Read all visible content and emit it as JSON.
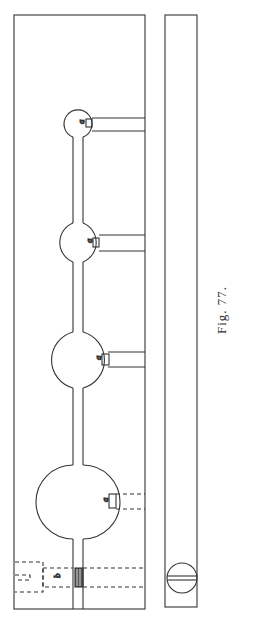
{
  "figure": {
    "caption": "Fig. 77.",
    "labels": {
      "valve": "a",
      "piston": "b",
      "inlet": "c"
    },
    "colors": {
      "line": "#333333",
      "background": "#ffffff"
    },
    "bulbs": [
      {
        "index": 1,
        "cy": 124,
        "r": 14,
        "label": "a",
        "connection": "solid"
      },
      {
        "index": 2,
        "cy": 242,
        "r": 21,
        "label": "a",
        "connection": "solid"
      },
      {
        "index": 3,
        "cy": 360,
        "r": 29,
        "label": "a",
        "connection": "solid"
      },
      {
        "index": 4,
        "cy": 502,
        "r": 37,
        "label": "a",
        "connection": "dashed"
      }
    ]
  }
}
